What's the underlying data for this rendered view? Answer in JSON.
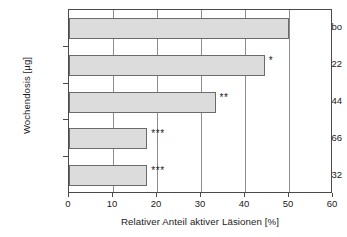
{
  "chart_data": {
    "type": "bar",
    "orientation": "horizontal",
    "title": "",
    "xlabel": "Relativer Anteil aktiver Läsionen [%]",
    "ylabel": "Wochendosis [µg]",
    "categories": [
      "Placebo",
      "22",
      "44",
      "66",
      "132"
    ],
    "values": [
      50.0,
      44.5,
      33.3,
      17.8,
      17.8
    ],
    "annotations": [
      "",
      "*",
      "**",
      "***",
      "***"
    ],
    "xlim": [
      0,
      60
    ],
    "xticks": [
      0,
      10,
      20,
      30,
      40,
      50,
      60
    ],
    "xtick_labels": [
      "0",
      "10",
      "20",
      "30",
      "40",
      "50",
      "60"
    ],
    "grid": "vertical",
    "legend": "none",
    "bar_fill_color": "#dcdcdc",
    "bar_border_color": "#6b6b6b",
    "axis_color": "#4a4a4a",
    "grid_color": "#8d8d8d"
  },
  "axes": {
    "y_title": "Wochendosis [µg]",
    "x_title": "Relativer Anteil aktiver Läsionen [%]"
  },
  "series": {
    "bars": [
      {
        "category": "Placebo",
        "value": 50.0,
        "marker": ""
      },
      {
        "category": "22",
        "value": 44.5,
        "marker": "*"
      },
      {
        "category": "44",
        "value": 33.3,
        "marker": "**"
      },
      {
        "category": "66",
        "value": 17.8,
        "marker": "***"
      },
      {
        "category": "132",
        "value": 17.8,
        "marker": "***"
      }
    ]
  },
  "x_ticks": [
    {
      "label": "0",
      "value": 0
    },
    {
      "label": "10",
      "value": 10
    },
    {
      "label": "20",
      "value": 20
    },
    {
      "label": "30",
      "value": 30
    },
    {
      "label": "40",
      "value": 40
    },
    {
      "label": "50",
      "value": 50
    },
    {
      "label": "60",
      "value": 60
    }
  ]
}
